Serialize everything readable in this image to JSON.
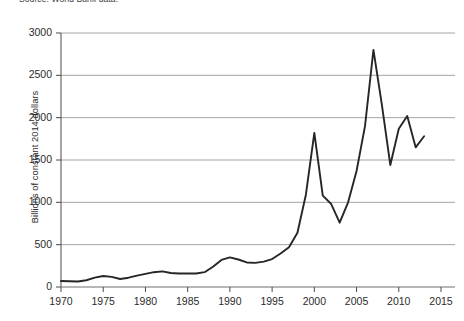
{
  "source_note": "Source: World Bank data.",
  "chart_data": {
    "type": "line",
    "title": "",
    "xlabel": "",
    "ylabel": "Billions of constant 2014 dollars",
    "xlim": [
      1970,
      2015
    ],
    "ylim": [
      0,
      3000
    ],
    "xticks": [
      1970,
      1975,
      1980,
      1985,
      1990,
      1995,
      2000,
      2005,
      2010,
      2015
    ],
    "yticks": [
      0,
      500,
      1000,
      1500,
      2000,
      2500,
      3000
    ],
    "grid": "horizontal",
    "legend": "none",
    "line_color": "#262626",
    "series": [
      {
        "name": "Value",
        "x": [
          1970,
          1971,
          1972,
          1973,
          1974,
          1975,
          1976,
          1977,
          1978,
          1979,
          1980,
          1981,
          1982,
          1983,
          1984,
          1985,
          1986,
          1987,
          1988,
          1989,
          1990,
          1991,
          1992,
          1993,
          1994,
          1995,
          1996,
          1997,
          1998,
          1999,
          2000,
          2001,
          2002,
          2003,
          2004,
          2005,
          2006,
          2007,
          2008,
          2009,
          2010,
          2011,
          2012,
          2013
        ],
        "values": [
          70,
          68,
          65,
          80,
          110,
          130,
          120,
          95,
          110,
          135,
          155,
          175,
          185,
          165,
          160,
          160,
          160,
          175,
          240,
          320,
          350,
          325,
          290,
          285,
          300,
          330,
          395,
          470,
          640,
          1090,
          1820,
          1080,
          980,
          760,
          1000,
          1370,
          1900,
          2800,
          2150,
          1440,
          1870,
          2020,
          1650,
          1780
        ]
      }
    ]
  }
}
